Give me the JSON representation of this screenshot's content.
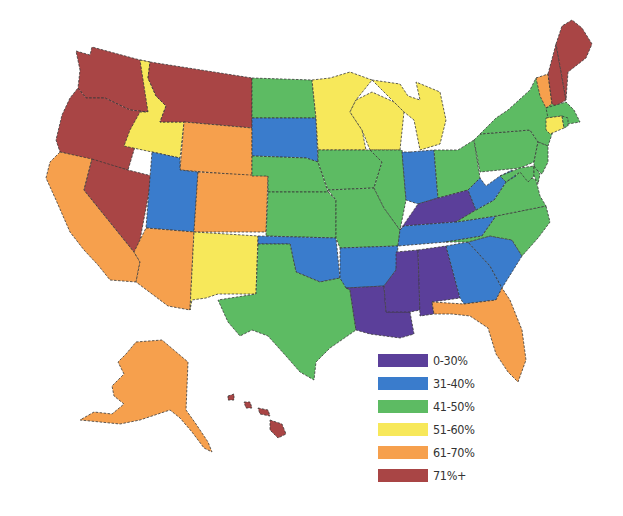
{
  "map": {
    "region": "United States",
    "legend": [
      {
        "label": "0-30%",
        "color": "#5b3f9a",
        "key": "c0"
      },
      {
        "label": "31-40%",
        "color": "#3a7ccc",
        "key": "c1"
      },
      {
        "label": "41-50%",
        "color": "#5dbb63",
        "key": "c2"
      },
      {
        "label": "51-60%",
        "color": "#f7e85a",
        "key": "c3"
      },
      {
        "label": "61-70%",
        "color": "#f6a04d",
        "key": "c4"
      },
      {
        "label": "71%+",
        "color": "#a94545",
        "key": "c5"
      }
    ],
    "states": {
      "WA": "71%+",
      "OR": "71%+",
      "MT": "71%+",
      "NV": "71%+",
      "ME": "71%+",
      "NH": "71%+",
      "HI": "71%+",
      "CA": "61-70%",
      "WY": "61-70%",
      "CO": "61-70%",
      "AZ": "61-70%",
      "FL": "61-70%",
      "VT": "61-70%",
      "AK": "61-70%",
      "ID": "51-60%",
      "NM": "51-60%",
      "MN": "51-60%",
      "WI": "51-60%",
      "MI": "51-60%",
      "CT": "51-60%",
      "ND": "41-50%",
      "NE": "41-50%",
      "KS": "41-50%",
      "IA": "41-50%",
      "MO": "41-50%",
      "IL": "41-50%",
      "TX": "41-50%",
      "OH": "41-50%",
      "PA": "41-50%",
      "NY": "41-50%",
      "VA": "41-50%",
      "NC": "41-50%",
      "MA": "41-50%",
      "NJ": "41-50%",
      "MD": "41-50%",
      "DE": "41-50%",
      "RI": "41-50%",
      "UT": "31-40%",
      "SD": "31-40%",
      "OK": "31-40%",
      "AR": "31-40%",
      "IN": "31-40%",
      "WV": "31-40%",
      "TN": "31-40%",
      "GA": "31-40%",
      "SC": "31-40%",
      "KY": "0-30%",
      "LA": "0-30%",
      "MS": "0-30%",
      "AL": "0-30%"
    }
  }
}
